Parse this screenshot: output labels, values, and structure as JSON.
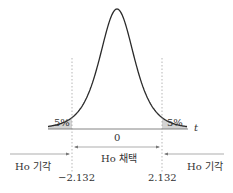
{
  "chart_data": {
    "type": "area",
    "title": "",
    "xlabel": "t",
    "ylabel": "",
    "center_label": "0",
    "critical_values": [
      -2.132,
      2.132
    ],
    "critical_labels": [
      "−2.132",
      "2.132"
    ],
    "tail_areas": [
      {
        "side": "left",
        "label": "5%",
        "value": 5
      },
      {
        "side": "right",
        "label": "5%",
        "value": 5
      }
    ],
    "regions": [
      {
        "name": "left-reject",
        "label": "Ho 기각"
      },
      {
        "name": "accept",
        "label": "Ho 채택"
      },
      {
        "name": "right-reject",
        "label": "Ho 기각"
      }
    ],
    "grid": false
  },
  "colors": {
    "curve": "#2a2a2a",
    "tail_fill": "#d4d4d4",
    "axis": "#555555",
    "dashed": "#888888",
    "text": "#333333"
  }
}
